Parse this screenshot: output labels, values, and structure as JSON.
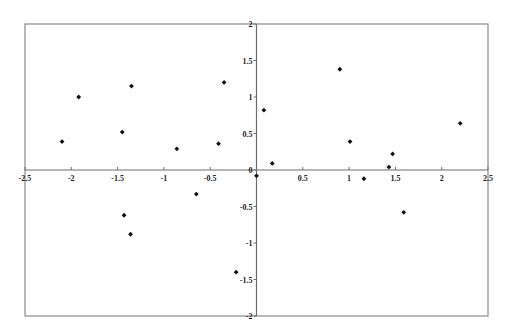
{
  "chart_data": {
    "type": "scatter",
    "title": "",
    "xlabel": "",
    "ylabel": "",
    "xlim": [
      -2.5,
      2.5
    ],
    "ylim": [
      -2,
      2
    ],
    "grid": false,
    "legend": null,
    "marker": "diamond",
    "marker_color": "#111111",
    "x_ticks": [
      -2.5,
      -2,
      -1.5,
      -1,
      -0.5,
      0,
      0.5,
      1,
      1.5,
      2,
      2.5
    ],
    "x_tick_labels": [
      "-2.5",
      "-2",
      "-1.5",
      "-1",
      "-0.5",
      "0",
      "0.5",
      "1",
      "1.5",
      "2",
      "2.5"
    ],
    "y_ticks": [
      2,
      1.5,
      1,
      0.5,
      0,
      -0.5,
      -1,
      -1.5,
      -2
    ],
    "y_tick_labels": [
      "2",
      "1.5",
      "1",
      "0.5",
      "0",
      "-0.5",
      "-1",
      "-1.5",
      "-2"
    ],
    "points": [
      {
        "x": -2.1,
        "y": 0.39
      },
      {
        "x": -1.92,
        "y": 1.0
      },
      {
        "x": -1.45,
        "y": 0.52
      },
      {
        "x": -1.35,
        "y": 1.15
      },
      {
        "x": -0.86,
        "y": 0.29
      },
      {
        "x": -0.41,
        "y": 0.36
      },
      {
        "x": -0.35,
        "y": 1.2
      },
      {
        "x": 0.08,
        "y": 0.82
      },
      {
        "x": 0.17,
        "y": 0.09
      },
      {
        "x": 0.9,
        "y": 1.38
      },
      {
        "x": 1.01,
        "y": 0.39
      },
      {
        "x": 1.43,
        "y": 0.04
      },
      {
        "x": 1.47,
        "y": 0.22
      },
      {
        "x": 2.2,
        "y": 0.64
      },
      {
        "x": 0.0,
        "y": -0.08
      },
      {
        "x": 1.16,
        "y": -0.12
      },
      {
        "x": -0.65,
        "y": -0.33
      },
      {
        "x": 1.59,
        "y": -0.58
      },
      {
        "x": -1.43,
        "y": -0.62
      },
      {
        "x": -1.36,
        "y": -0.88
      },
      {
        "x": -0.22,
        "y": -1.4
      }
    ]
  }
}
